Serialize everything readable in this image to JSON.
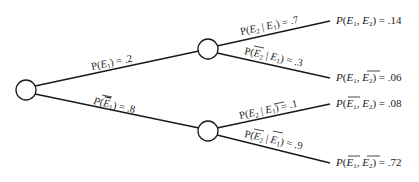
{
  "diagram": {
    "type": "probability-tree",
    "root": {
      "id": "root"
    },
    "level1": [
      {
        "id": "E1",
        "edge_label": "P(E1) = .2",
        "event": "E1",
        "complement": false,
        "probability": ".2"
      },
      {
        "id": "notE1",
        "edge_label": "P(~E1) = .8",
        "event": "E1",
        "complement": true,
        "probability": ".8"
      }
    ],
    "level2": [
      {
        "parent": "E1",
        "edge_label": "P(E2 | E1) = .7",
        "probability": ".7",
        "leaf_label": "P(E1, E2) = .14",
        "joint": ".14"
      },
      {
        "parent": "E1",
        "edge_label": "P(~E2 | E1) = .3",
        "probability": ".3",
        "leaf_label": "P(E1, ~E2) = .06",
        "joint": ".06"
      },
      {
        "parent": "notE1",
        "edge_label": "P(E2 | ~E1) = .1",
        "probability": ".1",
        "leaf_label": "P(~E1, E2) = .08",
        "joint": ".08"
      },
      {
        "parent": "notE1",
        "edge_label": "P(~E2 | ~E1) = .9",
        "probability": ".9",
        "leaf_label": "P(~E1, ~E2) = .72",
        "joint": ".72"
      }
    ],
    "text": {
      "P": "P",
      "E": "E",
      "sub1": "1",
      "sub2": "2",
      "open": "(",
      "close": ")",
      "bar": " | ",
      "comma": ", ",
      "eq": " = ",
      "v_e1": ".2",
      "v_ne1": ".8",
      "v_e2_e1": ".7",
      "v_ne2_e1": ".3",
      "v_e2_ne1": ".1",
      "v_ne2_ne1": ".9",
      "j1": ".14",
      "j2": ".06",
      "j3": ".08",
      "j4": ".72"
    }
  }
}
